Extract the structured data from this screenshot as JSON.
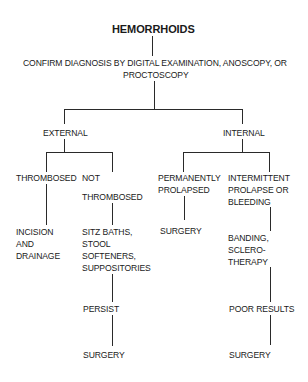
{
  "diagram": {
    "title": "HEMORRHOIDS",
    "confirm": {
      "line1": "CONFIRM DIAGNOSIS BY DIGITAL EXAMINATION, ANOSCOPY, OR",
      "line2": "PROCTOSCOPY"
    },
    "external": {
      "label": "EXTERNAL",
      "thrombosed": {
        "label": "THROMBOSED",
        "treatment": [
          "INCISION",
          "AND",
          "DRAINAGE"
        ]
      },
      "not_thrombosed": {
        "label": [
          "NOT",
          "THROMBOSED"
        ],
        "treatment": [
          "SITZ BATHS,",
          "STOOL",
          "SOFTENERS,",
          "SUPPOSITORIES"
        ],
        "persist": "PERSIST",
        "outcome": "SURGERY"
      }
    },
    "internal": {
      "label": "INTERNAL",
      "permanently_prolapsed": {
        "label": [
          "PERMANENTLY",
          "PROLAPSED"
        ],
        "treatment": "SURGERY"
      },
      "intermittent": {
        "label": [
          "INTERMITTENT",
          "PROLAPSE OR",
          "BLEEDING"
        ],
        "treatment": [
          "BANDING,",
          "SCLERO-",
          "THERAPY"
        ],
        "poor_results": "POOR RESULTS",
        "outcome": "SURGERY"
      }
    }
  }
}
